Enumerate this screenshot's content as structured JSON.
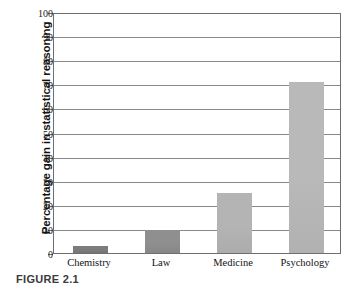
{
  "chart_data": {
    "type": "bar",
    "title": "",
    "xlabel": "",
    "ylabel": "Percentage gain in statistical reasoning",
    "categories": [
      "Chemistry",
      "Law",
      "Medicine",
      "Psychology"
    ],
    "values": [
      3,
      9.5,
      25,
      71
    ],
    "series": [
      {
        "name": "Percentage gain in statistical reasoning",
        "values": [
          3,
          9.5,
          25,
          71
        ]
      }
    ],
    "ylim": [
      0,
      100
    ],
    "ytick_step": 10,
    "ytick_labels": [
      "0",
      "10",
      "20",
      "30",
      "40",
      "50",
      "60",
      "70",
      "80",
      "90",
      "100"
    ],
    "grid": "horizontal",
    "legend": "none",
    "bar_colors": [
      "#7c7c7c",
      "#8f8f8f",
      "#b4b4b4",
      "#b9b9b9"
    ]
  },
  "axes": {
    "y_title": "Percentage gain in statistical reasoning",
    "ticks": [
      {
        "label": "100",
        "value": 100
      },
      {
        "label": "90",
        "value": 90
      },
      {
        "label": "80",
        "value": 80
      },
      {
        "label": "70",
        "value": 70
      },
      {
        "label": "60",
        "value": 60
      },
      {
        "label": "50",
        "value": 50
      },
      {
        "label": "40",
        "value": 40
      },
      {
        "label": "30",
        "value": 30
      },
      {
        "label": "20",
        "value": 20
      },
      {
        "label": "10",
        "value": 10
      },
      {
        "label": "0",
        "value": 0
      }
    ]
  },
  "bars": [
    {
      "label": "Chemistry",
      "value": 3,
      "color": "#7c7c7c"
    },
    {
      "label": "Law",
      "value": 9.5,
      "color": "#8f8f8f"
    },
    {
      "label": "Medicine",
      "value": 25,
      "color": "#b4b4b4"
    },
    {
      "label": "Psychology",
      "value": 71,
      "color": "#b9b9b9"
    }
  ],
  "caption": {
    "text": "FIGURE 2.1"
  },
  "colors": {
    "frame": "#6e6e6e",
    "gridline": "#8a8a8a",
    "background": "#ffffff",
    "text": "#111111"
  }
}
